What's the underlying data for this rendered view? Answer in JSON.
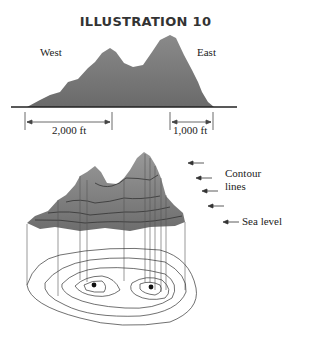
{
  "title": "ILLUSTRATION 10",
  "profile": {
    "west_label": "West",
    "east_label": "East",
    "dimension_left": "2,000 ft",
    "dimension_right": "1,000 ft"
  },
  "contour_view": {
    "contour_label_line1": "Contour",
    "contour_label_line2": "lines",
    "sea_level_label": "Sea level"
  },
  "colors": {
    "mountain_fill": "#808080",
    "mountain_dark": "#5f5f5f",
    "line": "#222222"
  }
}
